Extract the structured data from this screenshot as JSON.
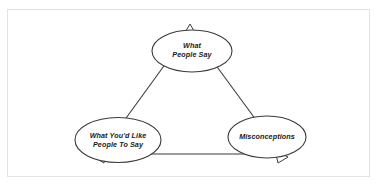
{
  "document": {
    "title": "Communication Triangle Diagram",
    "background_color": "#ffffff",
    "frame_color": "#e3e3e3",
    "shape_stroke_color": "#3b3b3b",
    "shape_fill_color": "#ffffff",
    "text_color": "#1a1a1a"
  },
  "diagram": {
    "type": "triangle-with-ellipse-nodes",
    "shape": "triangle",
    "arrowheads": 3,
    "nodes": [
      {
        "id": "what-people-say",
        "position": "top",
        "lines": [
          "What",
          "People Say"
        ],
        "full_text": "What People Say"
      },
      {
        "id": "what-youd-like-people-to-say",
        "position": "bottom-left",
        "lines": [
          "What You'd Like",
          "People To Say"
        ],
        "full_text": "What You'd Like People To Say"
      },
      {
        "id": "misconceptions",
        "position": "bottom-right",
        "lines": [
          "Misconceptions"
        ],
        "full_text": "Misconceptions"
      }
    ],
    "edges": [
      {
        "id": "edge-top-left",
        "from": "what-people-say",
        "to": "what-youd-like-people-to-say"
      },
      {
        "id": "edge-top-right",
        "from": "what-people-say",
        "to": "misconceptions"
      },
      {
        "id": "edge-bottom",
        "from": "what-youd-like-people-to-say",
        "to": "misconceptions"
      }
    ]
  }
}
